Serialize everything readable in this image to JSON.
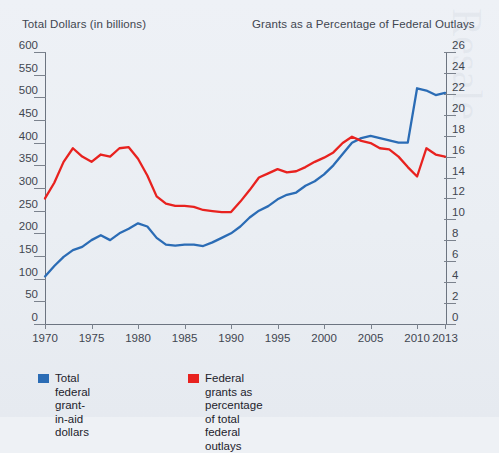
{
  "header": {
    "left_title": "Total Dollars (in billions)",
    "right_title": "Grants as a Percentage of Federal Outlays"
  },
  "legend": {
    "items": [
      {
        "label": "Total federal grant-in-aid\ndollars",
        "color": "#2b6cb5",
        "name": "legend-blue"
      },
      {
        "label": "Federal grants as percentage\nof total federal outlays",
        "color": "#e8221f",
        "name": "legend-red"
      }
    ]
  },
  "chart_data": {
    "type": "line",
    "title": "",
    "xlabel": "",
    "ylabel": "Total Dollars (in billions)",
    "y2label": "Grants as a Percentage of Federal Outlays",
    "grid": false,
    "legend_position": "bottom-left",
    "xlim": [
      1970,
      2013
    ],
    "ylim": [
      0,
      600
    ],
    "y2lim": [
      0,
      26
    ],
    "xticks": [
      1970,
      1975,
      1980,
      1985,
      1990,
      1995,
      2000,
      2005,
      2010,
      2013
    ],
    "yticks": [
      0,
      50,
      100,
      150,
      200,
      250,
      300,
      350,
      400,
      450,
      500,
      550,
      600
    ],
    "y2ticks": [
      0,
      2,
      4,
      6,
      8,
      10,
      12,
      14,
      16,
      18,
      20,
      22,
      24,
      26
    ],
    "x": [
      1970,
      1971,
      1972,
      1973,
      1974,
      1975,
      1976,
      1977,
      1978,
      1979,
      1980,
      1981,
      1982,
      1983,
      1984,
      1985,
      1986,
      1987,
      1988,
      1989,
      1990,
      1991,
      1992,
      1993,
      1994,
      1995,
      1996,
      1997,
      1998,
      1999,
      2000,
      2001,
      2002,
      2003,
      2004,
      2005,
      2006,
      2007,
      2008,
      2009,
      2010,
      2011,
      2012,
      2013
    ],
    "series": [
      {
        "name": "Total federal grant-in-aid dollars",
        "axis": "left",
        "color": "#2b6cb5",
        "units": "billions of dollars",
        "values": [
          105,
          128,
          148,
          163,
          170,
          185,
          196,
          185,
          200,
          210,
          222,
          215,
          190,
          175,
          173,
          175,
          175,
          172,
          180,
          190,
          200,
          215,
          235,
          250,
          260,
          275,
          285,
          290,
          305,
          315,
          330,
          350,
          375,
          400,
          410,
          415,
          410,
          405,
          400,
          400,
          520,
          515,
          505,
          510
        ]
      },
      {
        "name": "Federal grants as percentage of total federal outlays",
        "axis": "right",
        "color": "#e8221f",
        "units": "percent",
        "values": [
          12.0,
          13.5,
          15.5,
          16.8,
          16.0,
          15.5,
          16.2,
          16.0,
          16.8,
          16.9,
          15.8,
          14.2,
          12.2,
          11.5,
          11.3,
          11.3,
          11.2,
          10.9,
          10.8,
          10.7,
          10.7,
          11.7,
          12.8,
          14.0,
          14.4,
          14.8,
          14.5,
          14.6,
          15.0,
          15.5,
          15.9,
          16.4,
          17.3,
          17.9,
          17.5,
          17.3,
          16.8,
          16.7,
          16.0,
          15.0,
          14.1,
          16.8,
          16.2,
          16.0
        ]
      }
    ]
  }
}
